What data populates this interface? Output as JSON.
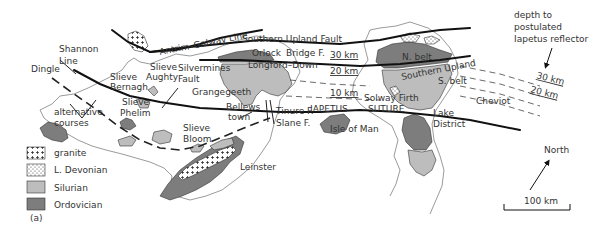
{
  "figure_label": "(a)",
  "legend": {
    "items": [
      {
        "key": "granite",
        "label": "granite",
        "pattern": "crosses",
        "color": "#ffffff"
      },
      {
        "key": "devonian",
        "label": "L. Devonian",
        "pattern": "dots",
        "color": "#ffffff"
      },
      {
        "key": "silurian",
        "label": "Silurian",
        "pattern": "solid",
        "color": "#bdbdbd"
      },
      {
        "key": "ordovician",
        "label": "Ordovician",
        "pattern": "solid",
        "color": "#7d7d7d"
      }
    ]
  },
  "labels": {
    "antrim_galway": "Antrim–Galway Line",
    "southern_upland_fault": "Southern Upland Fault",
    "orlock_bridge": "Orlock",
    "orlock_bridge2": "Bridge F.",
    "longford_down": "Longford–Down",
    "shannon1": "Shannon",
    "shannon2": "Line",
    "dingle": "Dingle",
    "slieve_bernagh1": "Slieve",
    "slieve_bernagh2": "Bernagh",
    "slieve_aughty1": "Slieve",
    "slieve_aughty2": "Aughty",
    "silvermines1": "Silvermines",
    "silvermines2": "Fault",
    "grangegeeth": "Grangegeeth",
    "alt1": "alternative",
    "alt2": "courses",
    "slieve_phelim1": "Slieve",
    "slieve_phelim2": "Phelim",
    "slieve_bloom1": "Slieve",
    "slieve_bloom2": "Bloom",
    "bellewstown1": "Bellews",
    "bellewstown2": "town",
    "tinure": "Tinure F.",
    "slane": "Slane F.",
    "iapetus": "IAPETUS",
    "suture": "SUTURE",
    "isle_of_man": "Isle of Man",
    "leinster": "Leinster",
    "solway": "Solway Firth",
    "n_belt": "N. belt",
    "southern_upland": "Southern Upland",
    "s_belt": "S. belt",
    "cheviot": "Cheviot",
    "lake1": "Lake",
    "lake2": "District",
    "depth1": "depth to",
    "depth2": "postulated",
    "depth3": "Iapetus reflector",
    "north": "North",
    "scale": "100 km"
  },
  "depth_contours": {
    "map": [
      "30 km",
      "20 km",
      "10 km"
    ],
    "offshore": [
      "30 km",
      "20 km"
    ]
  },
  "colors": {
    "ordovician": "#7d7d7d",
    "silurian": "#bdbdbd",
    "line": "#111111"
  }
}
